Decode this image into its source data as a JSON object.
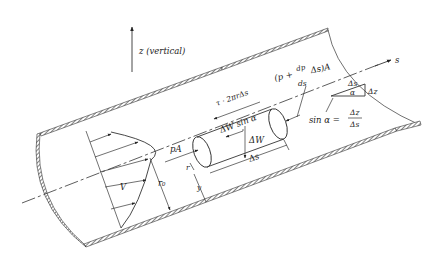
{
  "figure": {
    "type": "fluid-mechanics-pipe-flow-free-body-diagram",
    "colors": {
      "ink": "#222222",
      "background": "#ffffff"
    }
  },
  "labels": {
    "vertical_axis": "z (vertical)",
    "s_axis": "s",
    "shear_force": "τ · 2πrΔs",
    "downstream_pressure_prefix": "(p +",
    "dp_numerator": "dp",
    "dp_denominator": "ds",
    "downstream_pressure_suffix": "Δs)A",
    "weight_component": "ΔW sin α",
    "weight": "ΔW",
    "upstream_pressure": "pA",
    "element_length": "Δs",
    "element_radius": "r",
    "distance_from_wall": "y",
    "pipe_radius": "r₀",
    "velocity": "V",
    "triangle_hyp": "Δs",
    "triangle_angle": "α",
    "triangle_rise": "Δz",
    "sin_lhs": "sin α =",
    "sin_num": "Δz",
    "sin_den": "Δs"
  }
}
